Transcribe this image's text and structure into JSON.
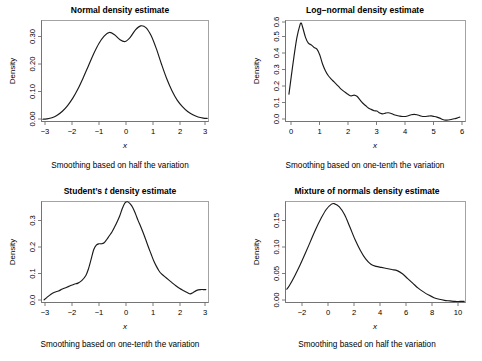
{
  "figure": {
    "background": "#ffffff",
    "line_color": "#1a1a1a",
    "axis_color": "#6e6e6e",
    "panel_count": 4,
    "layout": "2x2 grid of density estimate plots"
  },
  "panels": [
    {
      "key": "normal",
      "title": "Normal density estimate",
      "caption": "Smoothing based on half the variation",
      "xlabel": "x",
      "ylabel": "Density"
    },
    {
      "key": "lognormal",
      "title": "Log−normal density estimate",
      "caption": "Smoothing based on one-tenth the variation",
      "xlabel": "x",
      "ylabel": "Density"
    },
    {
      "key": "studentt",
      "title_pre": "Student’s ",
      "title_italic": "t",
      "title_post": " density estimate",
      "title": "Student’s t density estimate",
      "caption": "Smoothing based on one-tenth the variation",
      "xlabel": "x",
      "ylabel": "Density"
    },
    {
      "key": "mixture",
      "title": "Mixture of normals density estimate",
      "caption": "Smoothing based on half the variation",
      "xlabel": "x",
      "ylabel": "Density"
    }
  ],
  "chart_data": [
    {
      "type": "line",
      "key": "normal",
      "title": "Normal density estimate",
      "subtitle": "Smoothing based on half the variation",
      "xlabel": "x",
      "ylabel": "Density",
      "grid": false,
      "legend": "none",
      "xlim": [
        -3.2,
        3.2
      ],
      "ylim": [
        0.0,
        0.355
      ],
      "xticks": [
        -3,
        -2,
        -1,
        0,
        1,
        2,
        3
      ],
      "xticklabels": [
        "−3",
        "−2",
        "−1",
        "0",
        "1",
        "2",
        "3"
      ],
      "yticks": [
        0.0,
        0.1,
        0.2,
        0.3
      ],
      "yticklabels": [
        "0.00",
        "0.10",
        "0.20",
        "0.30"
      ],
      "x": [
        -3.15,
        -3.0,
        -2.8,
        -2.6,
        -2.4,
        -2.2,
        -2.0,
        -1.8,
        -1.6,
        -1.4,
        -1.2,
        -1.0,
        -0.8,
        -0.6,
        -0.4,
        -0.2,
        0.0,
        0.2,
        0.4,
        0.6,
        0.8,
        1.0,
        1.2,
        1.4,
        1.6,
        1.8,
        2.0,
        2.2,
        2.4,
        2.6,
        2.8,
        3.0,
        3.15
      ],
      "y": [
        0.008,
        0.009,
        0.013,
        0.022,
        0.036,
        0.056,
        0.082,
        0.115,
        0.154,
        0.196,
        0.238,
        0.274,
        0.3,
        0.313,
        0.305,
        0.288,
        0.281,
        0.296,
        0.322,
        0.336,
        0.33,
        0.302,
        0.256,
        0.201,
        0.15,
        0.108,
        0.075,
        0.052,
        0.035,
        0.024,
        0.016,
        0.012,
        0.011
      ]
    },
    {
      "type": "line",
      "key": "lognormal",
      "title": "Log−normal density estimate",
      "subtitle": "Smoothing based on one-tenth the variation",
      "xlabel": "x",
      "ylabel": "Density",
      "grid": false,
      "legend": "none",
      "xlim": [
        -0.1,
        6.2
      ],
      "ylim": [
        0.0,
        0.6
      ],
      "xticks": [
        0,
        1,
        2,
        3,
        4,
        5,
        6
      ],
      "xticklabels": [
        "0",
        "1",
        "2",
        "3",
        "4",
        "5",
        "6"
      ],
      "yticks": [
        0.0,
        0.1,
        0.2,
        0.3,
        0.4,
        0.5,
        0.6
      ],
      "yticklabels": [
        "0.0",
        "0.1",
        "0.2",
        "0.3",
        "0.4",
        "0.5",
        "0.6"
      ],
      "x": [
        0.02,
        0.1,
        0.2,
        0.3,
        0.4,
        0.45,
        0.5,
        0.6,
        0.7,
        0.8,
        0.9,
        1.0,
        1.1,
        1.2,
        1.3,
        1.4,
        1.5,
        1.6,
        1.7,
        1.8,
        1.9,
        2.0,
        2.1,
        2.2,
        2.3,
        2.4,
        2.5,
        2.6,
        2.7,
        2.8,
        2.9,
        3.0,
        3.1,
        3.2,
        3.3,
        3.4,
        3.5,
        3.6,
        3.7,
        3.8,
        3.9,
        4.0,
        4.1,
        4.2,
        4.3,
        4.4,
        4.5,
        4.6,
        4.7,
        4.8,
        4.9,
        5.0,
        5.1,
        5.2,
        5.3,
        5.4,
        5.5,
        5.6,
        5.7,
        5.8,
        5.9,
        6.0
      ],
      "y": [
        0.163,
        0.265,
        0.39,
        0.5,
        0.57,
        0.585,
        0.56,
        0.5,
        0.465,
        0.455,
        0.44,
        0.43,
        0.395,
        0.34,
        0.3,
        0.272,
        0.252,
        0.235,
        0.218,
        0.2,
        0.185,
        0.172,
        0.16,
        0.152,
        0.157,
        0.15,
        0.13,
        0.11,
        0.095,
        0.08,
        0.072,
        0.064,
        0.062,
        0.05,
        0.045,
        0.05,
        0.052,
        0.048,
        0.04,
        0.036,
        0.032,
        0.03,
        0.03,
        0.034,
        0.04,
        0.042,
        0.04,
        0.035,
        0.03,
        0.03,
        0.032,
        0.033,
        0.03,
        0.026,
        0.02,
        0.012,
        0.008,
        0.009,
        0.012,
        0.016,
        0.02,
        0.026
      ]
    },
    {
      "type": "line",
      "key": "studentt",
      "title": "Student’s t density estimate",
      "subtitle": "Smoothing based on one-tenth the variation",
      "xlabel": "x",
      "ylabel": "Density",
      "grid": false,
      "legend": "none",
      "xlim": [
        -3.2,
        3.2
      ],
      "ylim": [
        0.0,
        0.375
      ],
      "xticks": [
        -3,
        -2,
        -1,
        0,
        1,
        2,
        3
      ],
      "xticklabels": [
        "−3",
        "−2",
        "−1",
        "0",
        "1",
        "2",
        "3"
      ],
      "yticks": [
        0.0,
        0.1,
        0.2,
        0.3
      ],
      "yticklabels": [
        "0.0",
        "0.1",
        "0.2",
        "0.3"
      ],
      "x": [
        -3.1,
        -3.0,
        -2.85,
        -2.7,
        -2.55,
        -2.4,
        -2.25,
        -2.1,
        -1.95,
        -1.8,
        -1.65,
        -1.5,
        -1.4,
        -1.3,
        -1.2,
        -1.1,
        -1.0,
        -0.9,
        -0.8,
        -0.7,
        -0.6,
        -0.5,
        -0.4,
        -0.3,
        -0.2,
        -0.1,
        0.0,
        0.1,
        0.2,
        0.3,
        0.4,
        0.5,
        0.6,
        0.7,
        0.8,
        0.9,
        1.0,
        1.1,
        1.2,
        1.3,
        1.4,
        1.5,
        1.65,
        1.8,
        1.95,
        2.1,
        2.25,
        2.4,
        2.5,
        2.6,
        2.75,
        2.9,
        3.0,
        3.1
      ],
      "y": [
        0.01,
        0.018,
        0.03,
        0.038,
        0.043,
        0.05,
        0.056,
        0.062,
        0.068,
        0.072,
        0.082,
        0.1,
        0.125,
        0.16,
        0.196,
        0.213,
        0.218,
        0.218,
        0.222,
        0.234,
        0.248,
        0.262,
        0.28,
        0.3,
        0.322,
        0.35,
        0.37,
        0.374,
        0.366,
        0.352,
        0.33,
        0.305,
        0.282,
        0.258,
        0.232,
        0.205,
        0.18,
        0.155,
        0.135,
        0.118,
        0.106,
        0.098,
        0.086,
        0.074,
        0.062,
        0.052,
        0.044,
        0.036,
        0.032,
        0.036,
        0.045,
        0.048,
        0.048,
        0.048
      ]
    },
    {
      "type": "line",
      "key": "mixture",
      "title": "Mixture of normals density estimate",
      "subtitle": "Smoothing based on half the variation",
      "xlabel": "x",
      "ylabel": "Density",
      "grid": false,
      "legend": "none",
      "xlim": [
        -3.3,
        10.4
      ],
      "ylim": [
        0.0,
        0.19
      ],
      "xticks": [
        -2,
        0,
        2,
        4,
        6,
        8,
        10
      ],
      "xticklabels": [
        "−2",
        "0",
        "2",
        "4",
        "6",
        "8",
        "10"
      ],
      "yticks": [
        0.0,
        0.05,
        0.1,
        0.15
      ],
      "yticklabels": [
        "0.00",
        "0.05",
        "0.10",
        "0.15"
      ],
      "x": [
        -3.2,
        -3.0,
        -2.6,
        -2.2,
        -1.8,
        -1.4,
        -1.0,
        -0.6,
        -0.2,
        0.2,
        0.4,
        0.8,
        1.2,
        1.6,
        2.0,
        2.4,
        2.8,
        3.2,
        3.6,
        4.0,
        4.4,
        4.8,
        5.2,
        5.6,
        6.0,
        6.4,
        6.8,
        7.2,
        7.6,
        8.0,
        8.4,
        8.8,
        9.2,
        9.6,
        10.0,
        10.3
      ],
      "y": [
        0.025,
        0.032,
        0.05,
        0.07,
        0.092,
        0.115,
        0.138,
        0.158,
        0.175,
        0.185,
        0.186,
        0.18,
        0.165,
        0.142,
        0.118,
        0.098,
        0.082,
        0.072,
        0.068,
        0.066,
        0.064,
        0.062,
        0.06,
        0.054,
        0.045,
        0.036,
        0.027,
        0.02,
        0.014,
        0.009,
        0.006,
        0.004,
        0.003,
        0.002,
        0.002,
        0.002
      ]
    }
  ]
}
